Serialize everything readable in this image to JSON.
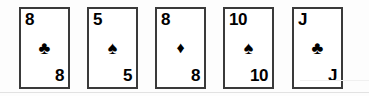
{
  "scene": {
    "title": "Playing card hand",
    "background_color": "#fdfdfd",
    "card_border_color": "#3a3a3a",
    "card_face_color": "#ffffff",
    "ink_color": "#000000",
    "card_count": 5
  },
  "cards": [
    {
      "rank": "8",
      "suit_name": "clubs",
      "suit_glyph": "♣",
      "suit_color": "#000000",
      "rank_top_left": "8",
      "rank_bottom_right": "8",
      "label": "8 of clubs"
    },
    {
      "rank": "5",
      "suit_name": "spades",
      "suit_glyph": "♠",
      "suit_color": "#000000",
      "rank_top_left": "5",
      "rank_bottom_right": "5",
      "label": "5 of spades"
    },
    {
      "rank": "8",
      "suit_name": "diamonds",
      "suit_glyph": "♦",
      "suit_color": "#000000",
      "rank_top_left": "8",
      "rank_bottom_right": "8",
      "label": "8 of diamonds"
    },
    {
      "rank": "10",
      "suit_name": "spades",
      "suit_glyph": "♠",
      "suit_color": "#000000",
      "rank_top_left": "10",
      "rank_bottom_right": "10",
      "label": "10 of spades"
    },
    {
      "rank": "J",
      "suit_name": "clubs",
      "suit_glyph": "♣",
      "suit_color": "#000000",
      "rank_top_left": "J",
      "rank_bottom_right": "J",
      "label": "Jack of clubs"
    }
  ]
}
